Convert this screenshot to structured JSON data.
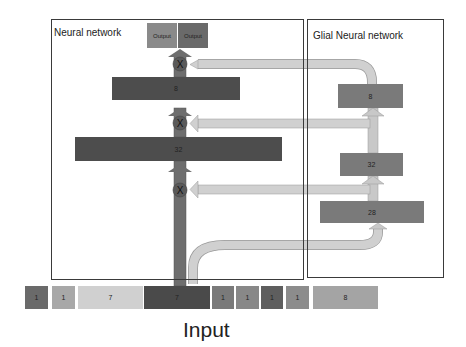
{
  "neural_network": {
    "title": "Neural network",
    "outputs": [
      "Output",
      "Output"
    ],
    "layers": [
      {
        "label": "8"
      },
      {
        "label": "32"
      }
    ],
    "gate_symbol": "X"
  },
  "glial_network": {
    "title": "Glial Neural network",
    "layers": [
      {
        "label": "8"
      },
      {
        "label": "32"
      },
      {
        "label": "28"
      }
    ]
  },
  "input": {
    "label": "Input",
    "cells": [
      "1",
      "1",
      "7",
      "7",
      "1",
      "1",
      "1",
      "1",
      "8"
    ]
  },
  "colors": {
    "frame": "#3a3a3a",
    "nn_layer": "#4d4d4d",
    "glial_layer": "#7a7a7a",
    "main_arrow": "#6e6e6e",
    "glial_arrow": "#c8c8c8",
    "gate": "#5a5a5a",
    "output_1": "#8a8a8a",
    "output_2": "#6a6a6a"
  }
}
